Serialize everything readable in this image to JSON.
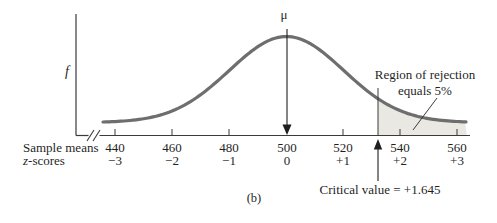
{
  "figure": {
    "y_axis_label": "f",
    "mu_label": "μ",
    "caption": "(b)",
    "x_axis": {
      "row1_label": "Sample means",
      "row2_label": "z-scores",
      "sample_means": [
        "440",
        "460",
        "480",
        "500",
        "520",
        "540",
        "560"
      ],
      "z_scores": [
        "−3",
        "−2",
        "−1",
        "0",
        "+1",
        "+2",
        "+3"
      ]
    },
    "annotations": {
      "rejection_line1": "Region of rejection",
      "rejection_line2": "equals 5%",
      "critical_value": "Critical value = +1.645"
    },
    "colors": {
      "curve": "#6e6e6e",
      "shade": "#e9e8e2",
      "axis": "#3a3a3a",
      "text": "#1f1f1f"
    }
  },
  "chart_data": {
    "type": "area",
    "xlabel": "Sample means / z-scores",
    "ylabel": "f",
    "x_ticks_sample_means": [
      440,
      460,
      480,
      500,
      520,
      540,
      560
    ],
    "x_ticks_z_scores": [
      -3,
      -2,
      -1,
      0,
      1,
      2,
      3
    ],
    "distribution": "normal",
    "mean": 500,
    "sd_per_z_unit": 20,
    "critical_value_z": 1.645,
    "rejection_region_side": "right",
    "rejection_region_area_pct": 5,
    "annotations": [
      "μ",
      "Region of rejection equals 5%",
      "Critical value = +1.645"
    ],
    "caption": "(b)"
  }
}
